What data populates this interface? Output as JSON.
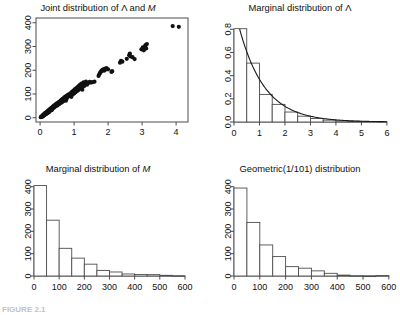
{
  "figure": {
    "background": "#ffffff",
    "axis_color": "#4d4d4d",
    "data_color": "#111111",
    "curve_color": "#1a1a1a",
    "bar_fill": "#ffffff",
    "bar_stroke": "#4d4d4d",
    "caption_fragment": "FIGURE 2.1"
  },
  "panels": [
    {
      "key": "joint",
      "title_prefix": "Joint distribution of ",
      "title_sym1": "Λ",
      "title_mid": " and ",
      "title_sym2": "M"
    },
    {
      "key": "marginal_lambda",
      "title_prefix": "Marginal distribution of ",
      "title_sym1": "Λ",
      "title_mid": "",
      "title_sym2": ""
    },
    {
      "key": "marginal_m",
      "title_prefix": "Marginal distribution of ",
      "title_sym1": "",
      "title_mid": "",
      "title_sym2": "M"
    },
    {
      "key": "geometric",
      "title_prefix": "Geometric(1/101) distribution",
      "title_sym1": "",
      "title_mid": "",
      "title_sym2": ""
    }
  ],
  "chart_data": [
    {
      "type": "scatter",
      "key": "joint",
      "title": "Joint distribution of Λ and M",
      "xlabel": "",
      "ylabel": "",
      "xlim": [
        -0.12,
        4.35
      ],
      "ylim": [
        -18,
        420
      ],
      "xticks": [
        0,
        1,
        2,
        3,
        4
      ],
      "yticks": [
        0,
        100,
        200,
        300,
        400
      ],
      "grid": false,
      "legend": "none",
      "point_size": 2.1,
      "points": [
        [
          0.02,
          2
        ],
        [
          0.03,
          4
        ],
        [
          0.05,
          6
        ],
        [
          0.06,
          3
        ],
        [
          0.07,
          9
        ],
        [
          0.08,
          7
        ],
        [
          0.09,
          12
        ],
        [
          0.1,
          8
        ],
        [
          0.11,
          14
        ],
        [
          0.12,
          10
        ],
        [
          0.13,
          17
        ],
        [
          0.14,
          13
        ],
        [
          0.15,
          19
        ],
        [
          0.16,
          15
        ],
        [
          0.17,
          22
        ],
        [
          0.18,
          16
        ],
        [
          0.19,
          24
        ],
        [
          0.2,
          21
        ],
        [
          0.21,
          26
        ],
        [
          0.22,
          19
        ],
        [
          0.23,
          29
        ],
        [
          0.24,
          25
        ],
        [
          0.25,
          31
        ],
        [
          0.26,
          23
        ],
        [
          0.27,
          33
        ],
        [
          0.28,
          28
        ],
        [
          0.29,
          36
        ],
        [
          0.3,
          30
        ],
        [
          0.31,
          38
        ],
        [
          0.32,
          34
        ],
        [
          0.33,
          41
        ],
        [
          0.34,
          32
        ],
        [
          0.35,
          43
        ],
        [
          0.36,
          37
        ],
        [
          0.37,
          46
        ],
        [
          0.38,
          40
        ],
        [
          0.39,
          48
        ],
        [
          0.4,
          42
        ],
        [
          0.41,
          51
        ],
        [
          0.42,
          45
        ],
        [
          0.44,
          53
        ],
        [
          0.45,
          47
        ],
        [
          0.46,
          56
        ],
        [
          0.47,
          50
        ],
        [
          0.48,
          58
        ],
        [
          0.49,
          54
        ],
        [
          0.5,
          61
        ],
        [
          0.51,
          52
        ],
        [
          0.53,
          63
        ],
        [
          0.54,
          59
        ],
        [
          0.55,
          66
        ],
        [
          0.56,
          57
        ],
        [
          0.58,
          68
        ],
        [
          0.59,
          64
        ],
        [
          0.6,
          71
        ],
        [
          0.61,
          62
        ],
        [
          0.62,
          73
        ],
        [
          0.63,
          69
        ],
        [
          0.64,
          76
        ],
        [
          0.65,
          66
        ],
        [
          0.66,
          78
        ],
        [
          0.67,
          74
        ],
        [
          0.68,
          81
        ],
        [
          0.69,
          70
        ],
        [
          0.7,
          83
        ],
        [
          0.71,
          79
        ],
        [
          0.72,
          86
        ],
        [
          0.73,
          75
        ],
        [
          0.74,
          88
        ],
        [
          0.75,
          84
        ],
        [
          0.76,
          72
        ],
        [
          0.77,
          91
        ],
        [
          0.78,
          80
        ],
        [
          0.79,
          93
        ],
        [
          0.8,
          86
        ],
        [
          0.82,
          96
        ],
        [
          0.84,
          90
        ],
        [
          0.86,
          99
        ],
        [
          0.88,
          94
        ],
        [
          0.9,
          104
        ],
        [
          0.92,
          88
        ],
        [
          0.94,
          109
        ],
        [
          0.96,
          98
        ],
        [
          0.98,
          114
        ],
        [
          1.0,
          102
        ],
        [
          1.02,
          119
        ],
        [
          1.04,
          107
        ],
        [
          1.06,
          124
        ],
        [
          1.08,
          112
        ],
        [
          1.1,
          129
        ],
        [
          1.12,
          116
        ],
        [
          1.14,
          134
        ],
        [
          1.16,
          121
        ],
        [
          1.18,
          139
        ],
        [
          1.2,
          126
        ],
        [
          1.22,
          144
        ],
        [
          1.24,
          118
        ],
        [
          1.26,
          130
        ],
        [
          1.28,
          149
        ],
        [
          1.3,
          134
        ],
        [
          1.32,
          141
        ],
        [
          1.35,
          152
        ],
        [
          1.38,
          139
        ],
        [
          1.42,
          146
        ],
        [
          1.46,
          151
        ],
        [
          1.5,
          148
        ],
        [
          1.55,
          150
        ],
        [
          1.6,
          152
        ],
        [
          1.72,
          176
        ],
        [
          1.74,
          183
        ],
        [
          1.76,
          188
        ],
        [
          1.78,
          192
        ],
        [
          1.8,
          196
        ],
        [
          1.82,
          199
        ],
        [
          1.84,
          201
        ],
        [
          1.86,
          204
        ],
        [
          1.88,
          198
        ],
        [
          1.9,
          206
        ],
        [
          1.92,
          202
        ],
        [
          1.95,
          209
        ],
        [
          2.0,
          204
        ],
        [
          2.1,
          193
        ],
        [
          2.12,
          196
        ],
        [
          2.35,
          232
        ],
        [
          2.38,
          240
        ],
        [
          2.42,
          236
        ],
        [
          2.55,
          248
        ],
        [
          2.62,
          263
        ],
        [
          2.64,
          270
        ],
        [
          2.66,
          258
        ],
        [
          2.72,
          255
        ],
        [
          2.78,
          247
        ],
        [
          2.98,
          288
        ],
        [
          3.02,
          296
        ],
        [
          3.05,
          284
        ],
        [
          3.08,
          300
        ],
        [
          3.1,
          306
        ],
        [
          3.12,
          292
        ],
        [
          3.14,
          310
        ],
        [
          3.9,
          386
        ],
        [
          4.08,
          383
        ]
      ]
    },
    {
      "type": "bar",
      "key": "marginal_lambda",
      "title": "Marginal distribution of Λ",
      "xlabel": "",
      "ylabel": "",
      "xlim": [
        0,
        6.2
      ],
      "ylim": [
        0,
        0.88
      ],
      "xticks": [
        0,
        1,
        2,
        3,
        4,
        5,
        6
      ],
      "yticks": [
        0.0,
        0.2,
        0.4,
        0.6,
        0.8
      ],
      "ytick_labels": [
        "0.0",
        "0.2",
        "0.4",
        "0.6",
        "0.8"
      ],
      "grid": false,
      "legend": "none",
      "bin_width": 0.5,
      "bin_edges": [
        0,
        0.5,
        1,
        1.5,
        2,
        2.5,
        3,
        3.5,
        4,
        4.5,
        5,
        5.5,
        6
      ],
      "values": [
        0.805,
        0.508,
        0.238,
        0.152,
        0.086,
        0.05,
        0.03,
        0.016,
        0.01,
        0.006,
        0.004,
        0.002
      ],
      "overlay_curve": {
        "name": "exponential density",
        "formula": "f(x) = exp(-x)",
        "x_start": 0.22,
        "x_end": 6.0,
        "rate": 1.0,
        "scale": 1.0
      }
    },
    {
      "type": "bar",
      "key": "marginal_m",
      "title": "Marginal distribution of M",
      "xlabel": "",
      "ylabel": "",
      "xlim": [
        0,
        620
      ],
      "ylim": [
        0,
        430
      ],
      "xticks": [
        0,
        100,
        200,
        300,
        400,
        500,
        600
      ],
      "yticks": [
        0,
        100,
        200,
        300,
        400
      ],
      "grid": false,
      "legend": "none",
      "bin_width": 50,
      "bin_edges": [
        0,
        50,
        100,
        150,
        200,
        250,
        300,
        350,
        400,
        450,
        500,
        550,
        600
      ],
      "values": [
        405,
        250,
        124,
        80,
        53,
        25,
        18,
        9,
        7,
        6,
        3,
        1
      ]
    },
    {
      "type": "bar",
      "key": "geometric",
      "title": "Geometric(1/101) distribution",
      "xlabel": "",
      "ylabel": "",
      "xlim": [
        0,
        620
      ],
      "ylim": [
        0,
        430
      ],
      "xticks": [
        0,
        100,
        200,
        300,
        400,
        500,
        600
      ],
      "yticks": [
        0,
        100,
        200,
        300,
        400
      ],
      "grid": false,
      "legend": "none",
      "bin_width": 50,
      "bin_edges": [
        0,
        50,
        100,
        150,
        200,
        250,
        300,
        350,
        400,
        450,
        500,
        550,
        600
      ],
      "values": [
        394,
        240,
        139,
        87,
        42,
        35,
        23,
        12,
        4,
        1,
        0,
        2
      ]
    }
  ]
}
